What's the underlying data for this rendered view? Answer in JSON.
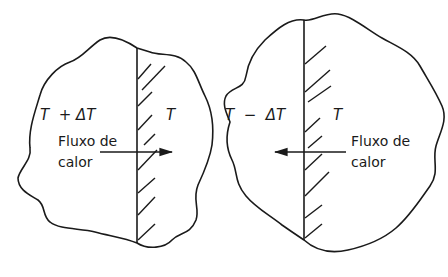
{
  "diagram": {
    "left_panel": {
      "temp_hot_label": "T  + ΔT",
      "temp_label": "T",
      "flow_label_line1": "Fluxo de",
      "flow_label_line2": "calor",
      "flow_direction": "right"
    },
    "right_panel": {
      "temp_cold_label": "T  −  ΔT",
      "temp_label": "T",
      "flow_label_line1": "Fluxo de",
      "flow_label_line2": "calor",
      "flow_direction": "left"
    },
    "colors": {
      "stroke": "#1a1a1a",
      "background": "#ffffff"
    }
  }
}
